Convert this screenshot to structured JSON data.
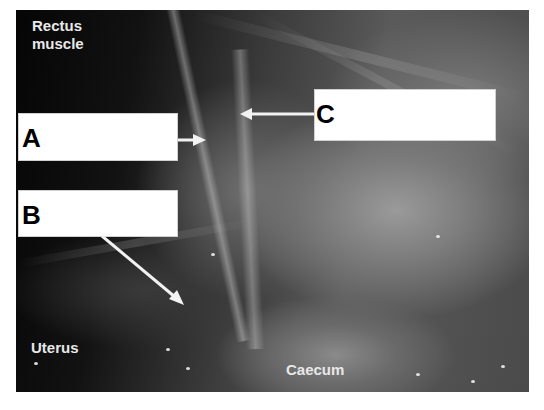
{
  "figure": {
    "anatomy_labels": {
      "rectus_muscle": "Rectus\nmuscle",
      "rectus_line1": "Rectus",
      "rectus_line2": "muscle",
      "uterus": "Uterus",
      "caecum": "Caecum"
    },
    "callouts": [
      {
        "letter": "A",
        "box_text": ""
      },
      {
        "letter": "B",
        "box_text": ""
      },
      {
        "letter": "C",
        "box_text": ""
      }
    ],
    "colors": {
      "label_text": "#e8e8e8",
      "callout_box": "#ffffff",
      "callout_letter": "#000000",
      "arrow": "#f2f2f2"
    }
  }
}
